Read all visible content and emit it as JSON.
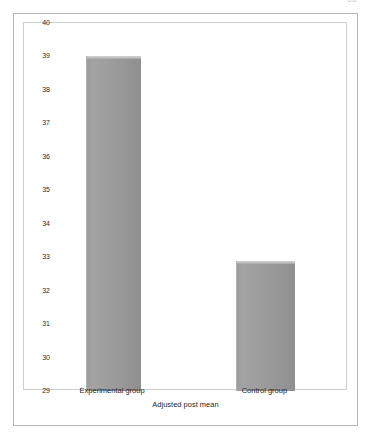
{
  "page": {
    "artifact_text": "66"
  },
  "chart_data": {
    "type": "bar",
    "title": "",
    "subtitle": "",
    "xlabel": "Adjusted post mean",
    "ylabel": "",
    "categories": [
      "Experimental group",
      "Control group"
    ],
    "values": [
      39.0,
      32.9
    ],
    "series": [
      {
        "name": "Adjusted post mean",
        "values": [
          39.0,
          32.9
        ]
      }
    ],
    "ylim": [
      29,
      40
    ],
    "y_ticks": [
      40,
      39,
      38,
      37,
      36,
      35,
      34,
      33,
      32,
      31,
      30,
      29
    ],
    "y_tick_labels": [
      "40",
      "39",
      "38",
      "37",
      "36",
      "35",
      "34",
      "33",
      "32",
      "31",
      "30",
      "29"
    ],
    "grid": false,
    "legend": false,
    "legend_position": "none",
    "bar_color": "#9a9a9a",
    "bar_top_highlight_color": "#c6c6c6",
    "plot_background": "#ffffff",
    "frame_color": "#b7b7b7",
    "axis_label_color": "#1f1f1f"
  }
}
